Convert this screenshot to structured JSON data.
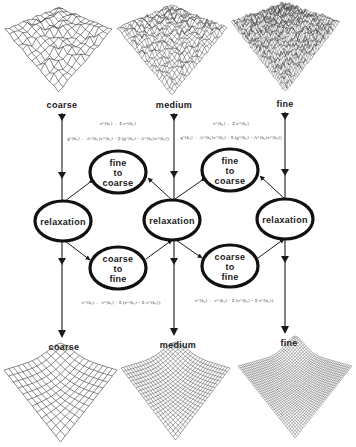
{
  "figure": {
    "type": "multigrid-scheme",
    "levels": [
      {
        "id": "coarse",
        "label": "coarse",
        "x": 62
      },
      {
        "id": "medium",
        "label": "medium",
        "x": 174
      },
      {
        "id": "fine",
        "label": "fine",
        "x": 285
      }
    ],
    "top_labels": [
      "coarse",
      "medium",
      "fine"
    ],
    "bottom_labels": [
      "coarse",
      "medium",
      "fine"
    ],
    "nodes": {
      "relaxation": [
        {
          "label": "relaxation",
          "cx": 63,
          "cy": 221
        },
        {
          "label": "relaxation",
          "cx": 172,
          "cy": 220
        },
        {
          "label": "relaxation",
          "cx": 285,
          "cy": 219
        }
      ],
      "fine_to_coarse": [
        {
          "lines": [
            "fine",
            "to",
            "coarse"
          ],
          "cx": 118,
          "cy": 172
        },
        {
          "lines": [
            "fine",
            "to",
            "coarse"
          ],
          "cx": 230,
          "cy": 170
        }
      ],
      "coarse_to_fine": [
        {
          "lines": [
            "coarse",
            "to",
            "fine"
          ],
          "cx": 118,
          "cy": 268
        },
        {
          "lines": [
            "coarse",
            "to",
            "fine"
          ],
          "cx": 230,
          "cy": 266
        }
      ]
    },
    "formulas": {
      "restriction_left_1": "v^{h₁} ← Σ v^{h₂}",
      "restriction_left_2": "g^{h₁} ← A^{h₁}v^{h₁} + Σ (g^{h₂} − A^{h₂}v^{h₂})",
      "restriction_right_1": "v^{h₂} ← Σ v^{h₃}",
      "restriction_right_2": "g^{h₂} ← A^{h₂}v^{h₂} + Σ (g^{h₃} − A^{h₃}v^{h₃})",
      "prolongation_left": "v^{h₂} ← v^{h₂} + Σ (v^{h₁} − Σ v^{h₂})",
      "prolongation_right": "v^{h₃} ← v^{h₃} + Σ (v^{h₂} − Σ v^{h₃})"
    },
    "surfaces_top": [
      {
        "name": "coarse-rough-surface",
        "grid": 12,
        "noise": 1.0
      },
      {
        "name": "medium-rough-surface",
        "grid": 22,
        "noise": 1.0
      },
      {
        "name": "fine-rough-surface",
        "grid": 36,
        "noise": 1.0
      }
    ],
    "surfaces_bottom": [
      {
        "name": "coarse-smooth-surface",
        "grid": 12
      },
      {
        "name": "medium-smooth-surface",
        "grid": 22
      },
      {
        "name": "fine-smooth-surface",
        "grid": 36
      }
    ],
    "colors": {
      "ink": "#1a1a1a",
      "mesh": "#3a3a3a",
      "background": "#ffffff"
    }
  }
}
